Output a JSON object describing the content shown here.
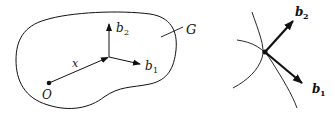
{
  "left_figure": {
    "region_label": "G",
    "origin_label": "O",
    "position_vector_label": "x",
    "basis": [
      {
        "symbol": "b",
        "subscript": "1"
      },
      {
        "symbol": "b",
        "subscript": "2"
      }
    ]
  },
  "right_figure": {
    "basis": [
      {
        "symbol": "b",
        "subscript": "1"
      },
      {
        "symbol": "b",
        "subscript": "2"
      }
    ]
  },
  "colors": {
    "ink": "#111111",
    "background": "#ffffff"
  }
}
